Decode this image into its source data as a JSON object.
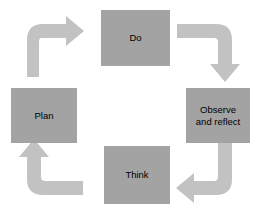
{
  "diagram": {
    "type": "cycle",
    "background_color": "#ffffff",
    "box_color": "#a3a3a3",
    "arrow_color": "#c2c2c2",
    "text_color": "#000000",
    "direction": "clockwise",
    "stages": [
      {
        "id": "do",
        "label": "Do",
        "position": "top"
      },
      {
        "id": "observe",
        "label": "Observe\nand reflect",
        "position": "right"
      },
      {
        "id": "think",
        "label": "Think",
        "position": "bottom"
      },
      {
        "id": "plan",
        "label": "Plan",
        "position": "left"
      }
    ],
    "arrows": [
      {
        "id": "plan-do",
        "from": "plan",
        "to": "do",
        "points": "up-right"
      },
      {
        "id": "do-observe",
        "from": "do",
        "to": "observe",
        "points": "right-down"
      },
      {
        "id": "observe-think",
        "from": "observe",
        "to": "think",
        "points": "down-left"
      },
      {
        "id": "think-plan",
        "from": "think",
        "to": "plan",
        "points": "left-up"
      }
    ]
  }
}
